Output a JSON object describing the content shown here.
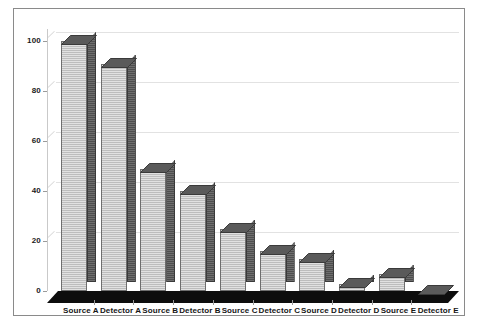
{
  "chart_data": {
    "type": "bar",
    "title": "",
    "subtitle": "",
    "xlabel": "",
    "ylabel": "",
    "categories": [
      "Source A",
      "Detector A",
      "Source B",
      "Detector B",
      "Source C",
      "Detector C",
      "Source D",
      "Detector D",
      "Source E",
      "Detector E"
    ],
    "values": [
      100,
      91,
      49,
      40,
      25,
      16,
      13,
      3,
      7,
      0
    ],
    "series": [
      {
        "name": "",
        "values": [
          100,
          91,
          49,
          40,
          25,
          16,
          13,
          3,
          7,
          0
        ]
      }
    ],
    "ylim": [
      0,
      100
    ],
    "yticks": [
      0,
      20,
      40,
      60,
      80,
      100
    ],
    "ytick_labels": [
      "0",
      "20",
      "40",
      "60",
      "80",
      "100"
    ],
    "grid": true,
    "grid_axis": "y",
    "legend": false,
    "legend_position": "none",
    "style_3d": true,
    "annotations": []
  },
  "style": {
    "background_color": "#ffffff",
    "frame_border_color": "#8a8a8a",
    "gridline_color": "#e2e2e2",
    "axis_line_color": "#c9c9c9",
    "bar_front_color": "#bdbdbd",
    "bar_side_color": "#4e4e4e",
    "bar_top_color": "#5a5a5a",
    "floor_color": "#0d0d0d",
    "tick_label_color": "#1a1a1a",
    "category_label_color": "#161616"
  }
}
